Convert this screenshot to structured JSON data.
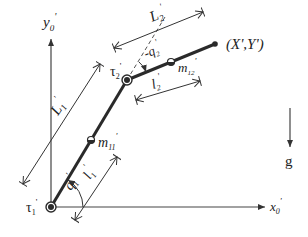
{
  "diagram": {
    "type": "two-link planar manipulator",
    "axes": {
      "x_label": "x",
      "x_sub": "0",
      "x_prime": "'",
      "y_label": "y",
      "y_sub": "0",
      "y_prime": "'"
    },
    "gravity": {
      "label": "g"
    },
    "joints": {
      "joint1": {
        "label": "τ",
        "sub": "1",
        "prime": "'"
      },
      "joint2": {
        "label": "τ",
        "sub": "2",
        "prime": "'"
      }
    },
    "end_effector": {
      "label": "(X',Y')"
    },
    "masses": {
      "m11": {
        "label": "m",
        "sub": "11",
        "prime": "'"
      },
      "m12": {
        "label": "m",
        "sub": "12",
        "prime": "'"
      }
    },
    "lengths": {
      "L1": {
        "label": "L",
        "sub": "1",
        "prime": "'"
      },
      "L2": {
        "label": "L",
        "sub": "2",
        "prime": "'"
      },
      "l1": {
        "label": "l",
        "sub": "1",
        "prime": "'"
      },
      "l2": {
        "label": "l",
        "sub": "2",
        "prime": "'"
      }
    },
    "angles": {
      "q1": {
        "label": "q",
        "sub": "1",
        "prime": "'"
      },
      "q2": {
        "label": "-q",
        "sub": "2",
        "prime": "'"
      }
    },
    "colors": {
      "link": "#2a2a2a",
      "axis": "#444444",
      "dimension": "#333333",
      "text": "#222222"
    }
  }
}
